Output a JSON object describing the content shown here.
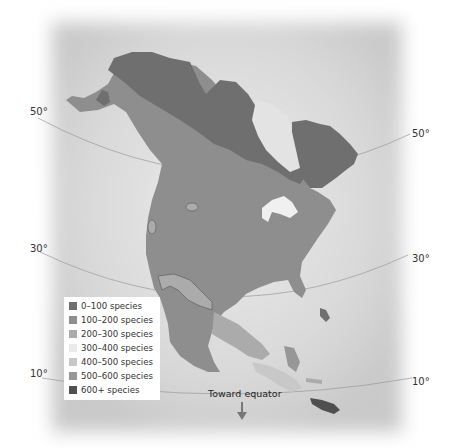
{
  "map": {
    "title": "",
    "region": "North America",
    "latitude_labels": [
      {
        "side": "left",
        "text": "50°"
      },
      {
        "side": "right",
        "text": "50°"
      },
      {
        "side": "left",
        "text": "30°"
      },
      {
        "side": "right",
        "text": "30°"
      },
      {
        "side": "left",
        "text": "10°"
      },
      {
        "side": "right",
        "text": "10°"
      }
    ],
    "equator_note": "Toward equator",
    "equator_arrow_icon": "arrow-down-icon"
  },
  "legend": {
    "items": [
      {
        "label": "0–100 species",
        "color": "#6f6f6f"
      },
      {
        "label": "100–200 species",
        "color": "#8e8e8e"
      },
      {
        "label": "200–300 species",
        "color": "#ababab"
      },
      {
        "label": "300–400 species",
        "color": "#eaeaea"
      },
      {
        "label": "400–500 species",
        "color": "#c8c8c8"
      },
      {
        "label": "500–600 species",
        "color": "#979797"
      },
      {
        "label": "600+ species",
        "color": "#4f4f4f"
      }
    ]
  },
  "colors": {
    "ocean": "#e2e2e2",
    "ocean_dark": "#cfcfcf",
    "land_100_200": "#8e8e8e",
    "land_0_100": "#6f6f6f",
    "land_200_300": "#ababab",
    "land_400_500": "#c8c8c8",
    "land_600_plus": "#4f4f4f",
    "lakes": "#f0f0f0"
  }
}
